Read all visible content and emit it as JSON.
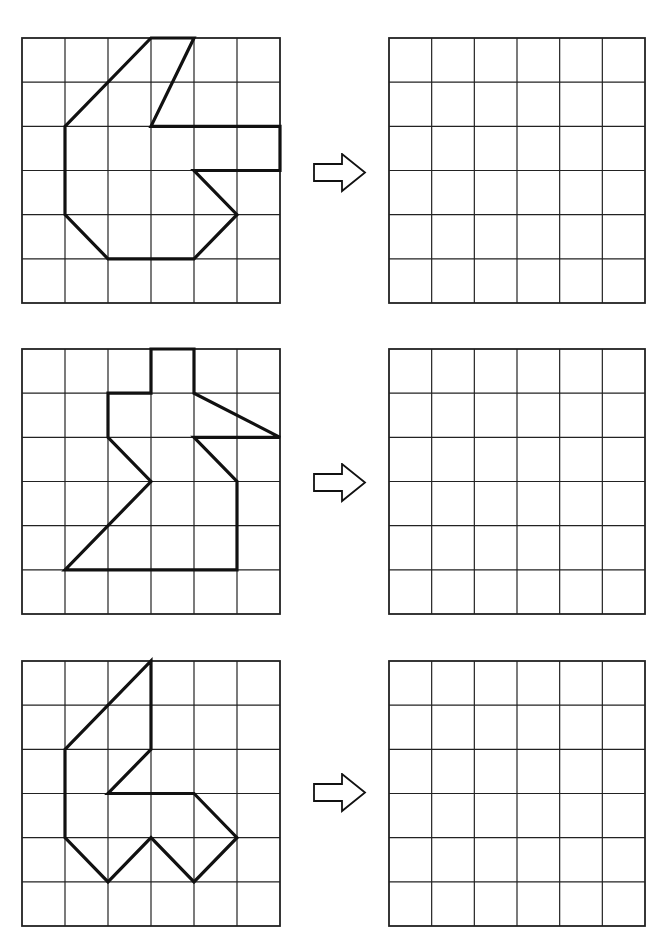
{
  "worksheet": {
    "grid": {
      "cols": 6,
      "rows": 6,
      "line_color": "#222222",
      "shape_color": "#111111"
    },
    "rows": [
      {
        "source_grid": {
          "x": 22,
          "y": 38,
          "w": 258,
          "h": 265
        },
        "target_grid": {
          "x": 389,
          "y": 38,
          "w": 256,
          "h": 265
        },
        "arrow": {
          "x": 313,
          "y": 153,
          "icon": "right-arrow-icon"
        },
        "shape": [
          [
            3,
            0
          ],
          [
            4,
            0
          ],
          [
            3,
            2
          ],
          [
            6,
            2
          ],
          [
            6,
            3
          ],
          [
            4,
            3
          ],
          [
            5,
            4
          ],
          [
            4,
            5
          ],
          [
            2,
            5
          ],
          [
            1,
            4
          ],
          [
            1,
            2
          ]
        ]
      },
      {
        "source_grid": {
          "x": 22,
          "y": 349,
          "w": 258,
          "h": 265
        },
        "target_grid": {
          "x": 389,
          "y": 349,
          "w": 256,
          "h": 265
        },
        "arrow": {
          "x": 313,
          "y": 463,
          "icon": "right-arrow-icon"
        },
        "shape": [
          [
            3,
            0
          ],
          [
            4,
            0
          ],
          [
            4,
            1
          ],
          [
            6,
            2
          ],
          [
            4,
            2
          ],
          [
            5,
            3
          ],
          [
            5,
            5
          ],
          [
            1,
            5
          ],
          [
            3,
            3
          ],
          [
            2,
            2
          ],
          [
            2,
            1
          ],
          [
            3,
            1
          ]
        ]
      },
      {
        "source_grid": {
          "x": 22,
          "y": 661,
          "w": 258,
          "h": 265
        },
        "target_grid": {
          "x": 389,
          "y": 661,
          "w": 256,
          "h": 265
        },
        "arrow": {
          "x": 313,
          "y": 773,
          "icon": "right-arrow-icon"
        },
        "shape": [
          [
            3,
            0
          ],
          [
            3,
            2
          ],
          [
            2,
            3
          ],
          [
            4,
            3
          ],
          [
            5,
            4
          ],
          [
            4,
            5
          ],
          [
            3,
            4
          ],
          [
            2,
            5
          ],
          [
            1,
            4
          ],
          [
            1,
            2
          ]
        ]
      }
    ]
  }
}
